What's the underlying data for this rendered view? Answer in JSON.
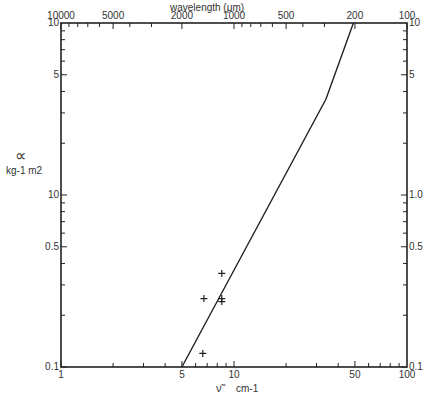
{
  "chart_data": {
    "type": "line",
    "title": "",
    "xlabel": "ν̃  cm-1",
    "ylabel": "α",
    "ylabel_units": "kg-1 m2",
    "top_axis_label": "wavelength (μm)",
    "x_scale": "log",
    "y_scale": "log",
    "xlim": [
      1,
      100
    ],
    "ylim": [
      0.1,
      10
    ],
    "x_tick_labels": [
      "1",
      "5",
      "10",
      "50",
      "100"
    ],
    "top_tick_labels": [
      "10000",
      "5000",
      "2000",
      "1000",
      "500",
      "200",
      "100"
    ],
    "y_tick_labels_left": [
      "10",
      "5",
      "10",
      "0.5",
      "0.1"
    ],
    "y_tick_labels_right": [
      "10",
      "5",
      "1.0",
      "0.5",
      "0.1"
    ],
    "grid": false,
    "series": [
      {
        "name": "model curve",
        "style": "line",
        "x": [
          5.0,
          34,
          49
        ],
        "y": [
          0.1,
          3.6,
          10
        ]
      },
      {
        "name": "measurements",
        "style": "plus-markers",
        "x": [
          6.7,
          8.5,
          8.5,
          8.5,
          6.6
        ],
        "y": [
          0.25,
          0.35,
          0.25,
          0.24,
          0.12
        ]
      }
    ]
  },
  "labels": {
    "top_axis": "wavelength (μm)",
    "x_axis_symbol": "ν̃",
    "x_axis_units": "cm-1",
    "y_axis_symbol": "∝",
    "y_axis_units": "kg-1 m2"
  }
}
